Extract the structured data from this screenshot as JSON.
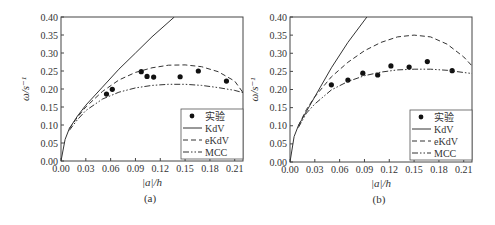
{
  "chart_data": [
    {
      "type": "line",
      "panel_label": "(a)",
      "xlabel": "|a|/h",
      "ylabel": "ω/s⁻¹",
      "xlim": [
        0,
        0.22
      ],
      "ylim": [
        0,
        0.4
      ],
      "xticks": [
        "0.00",
        "0.03",
        "0.06",
        "0.09",
        "0.12",
        "0.15",
        "0.18",
        "0.21"
      ],
      "yticks": [
        "0.00",
        "0.05",
        "0.10",
        "0.15",
        "0.20",
        "0.25",
        "0.30",
        "0.35",
        "0.40"
      ],
      "legend": [
        "实验",
        "KdV",
        "eKdV",
        "MCC"
      ],
      "legend_position": "lower right",
      "series": [
        {
          "name": "实验",
          "style": "scatter",
          "x": [
            0.055,
            0.062,
            0.097,
            0.104,
            0.112,
            0.144,
            0.166,
            0.2
          ],
          "y": [
            0.186,
            0.199,
            0.248,
            0.235,
            0.233,
            0.234,
            0.25,
            0.222
          ]
        },
        {
          "name": "KdV",
          "style": "solid",
          "x": [
            0,
            0.005,
            0.01,
            0.02,
            0.03,
            0.05,
            0.07,
            0.09,
            0.11,
            0.137
          ],
          "y": [
            0,
            0.06,
            0.09,
            0.125,
            0.155,
            0.205,
            0.255,
            0.3,
            0.345,
            0.4
          ]
        },
        {
          "name": "eKdV",
          "style": "dashed",
          "x": [
            0.01,
            0.02,
            0.03,
            0.05,
            0.07,
            0.09,
            0.11,
            0.13,
            0.15,
            0.17,
            0.19,
            0.21,
            0.22
          ],
          "y": [
            0.09,
            0.122,
            0.15,
            0.193,
            0.225,
            0.246,
            0.259,
            0.266,
            0.267,
            0.262,
            0.248,
            0.222,
            0.19
          ]
        },
        {
          "name": "MCC",
          "style": "dashdot",
          "x": [
            0.01,
            0.02,
            0.03,
            0.05,
            0.07,
            0.09,
            0.11,
            0.13,
            0.15,
            0.17,
            0.19,
            0.21,
            0.22
          ],
          "y": [
            0.085,
            0.115,
            0.14,
            0.172,
            0.191,
            0.203,
            0.21,
            0.213,
            0.213,
            0.21,
            0.204,
            0.196,
            0.19
          ]
        }
      ]
    },
    {
      "type": "line",
      "panel_label": "(b)",
      "xlabel": "|a|/h",
      "ylabel": "ω/s⁻¹",
      "xlim": [
        0,
        0.22
      ],
      "ylim": [
        0,
        0.4
      ],
      "xticks": [
        "0.00",
        "0.03",
        "0.06",
        "0.09",
        "0.12",
        "0.15",
        "0.18",
        "0.21"
      ],
      "yticks": [
        "0.00",
        "0.05",
        "0.10",
        "0.15",
        "0.20",
        "0.25",
        "0.30",
        "0.35",
        "0.40"
      ],
      "legend": [
        "实验",
        "KdV",
        "eKdV",
        "MCC"
      ],
      "legend_position": "lower right",
      "series": [
        {
          "name": "实验",
          "style": "scatter",
          "x": [
            0.05,
            0.07,
            0.088,
            0.106,
            0.122,
            0.144,
            0.166,
            0.196
          ],
          "y": [
            0.213,
            0.226,
            0.245,
            0.24,
            0.265,
            0.262,
            0.277,
            0.252
          ]
        },
        {
          "name": "KdV",
          "style": "solid",
          "x": [
            0,
            0.005,
            0.01,
            0.02,
            0.03,
            0.05,
            0.07,
            0.093
          ],
          "y": [
            0,
            0.07,
            0.1,
            0.14,
            0.18,
            0.26,
            0.33,
            0.4
          ]
        },
        {
          "name": "eKdV",
          "style": "dashed",
          "x": [
            0.01,
            0.02,
            0.03,
            0.05,
            0.07,
            0.09,
            0.11,
            0.13,
            0.15,
            0.17,
            0.19,
            0.21,
            0.22
          ],
          "y": [
            0.1,
            0.145,
            0.18,
            0.235,
            0.275,
            0.307,
            0.33,
            0.345,
            0.35,
            0.345,
            0.325,
            0.29,
            0.265
          ]
        },
        {
          "name": "MCC",
          "style": "dashdot",
          "x": [
            0.01,
            0.02,
            0.03,
            0.05,
            0.07,
            0.09,
            0.11,
            0.13,
            0.15,
            0.17,
            0.19,
            0.21,
            0.22
          ],
          "y": [
            0.095,
            0.135,
            0.16,
            0.199,
            0.222,
            0.238,
            0.248,
            0.254,
            0.256,
            0.256,
            0.253,
            0.247,
            0.244
          ]
        }
      ]
    }
  ]
}
